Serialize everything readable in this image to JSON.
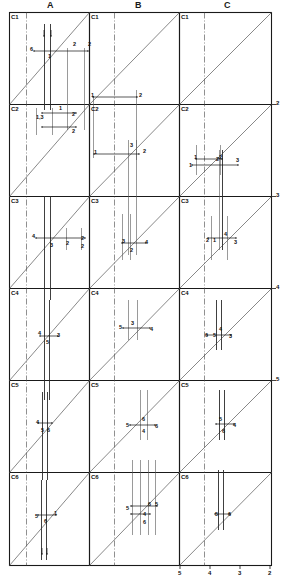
{
  "figure": {
    "type": "technical-grid-diagram",
    "width": 281,
    "height": 579,
    "columns": [
      {
        "key": "A",
        "label": "A",
        "x_header": 51
      },
      {
        "key": "B",
        "label": "B",
        "x_header": 139
      },
      {
        "key": "C",
        "label": "C",
        "x_header": 228
      }
    ],
    "rows": [
      {
        "key": "C1",
        "label": "C1"
      },
      {
        "key": "C2",
        "label": "C2"
      },
      {
        "key": "C3",
        "label": "C3"
      },
      {
        "key": "C4",
        "label": "C4"
      },
      {
        "key": "C5",
        "label": "C5"
      },
      {
        "key": "C6",
        "label": "C6"
      }
    ],
    "cell_ids": [
      "C1",
      "C1",
      "C1",
      "C2",
      "C2",
      "C2",
      "C3",
      "C3",
      "C3",
      "C4",
      "C4",
      "C4",
      "C5",
      "C5",
      "C5",
      "C6",
      "C6",
      "C6"
    ],
    "bottom_axis_ticks": [
      "5",
      "4",
      "3",
      "2"
    ],
    "right_axis_ticks": [
      "2",
      "3",
      "4",
      "5"
    ],
    "annotations_A": [
      {
        "text": "6",
        "x": 30,
        "y": 47
      },
      {
        "text": "1",
        "x": 48,
        "y": 54
      },
      {
        "text": "2",
        "x": 73,
        "y": 42
      },
      {
        "text": "2",
        "x": 88,
        "y": 42
      },
      {
        "text": "1,3",
        "x": 36,
        "y": 115
      },
      {
        "text": "1",
        "x": 59,
        "y": 106
      },
      {
        "text": "2",
        "x": 72,
        "y": 112
      },
      {
        "text": "2",
        "x": 72,
        "y": 129
      },
      {
        "text": "4",
        "x": 32,
        "y": 234
      },
      {
        "text": "3",
        "x": 50,
        "y": 243
      },
      {
        "text": "2",
        "x": 66,
        "y": 241
      },
      {
        "text": "2",
        "x": 81,
        "y": 236
      },
      {
        "text": "2",
        "x": 81,
        "y": 244
      },
      {
        "text": "4",
        "x": 38,
        "y": 331
      },
      {
        "text": "5",
        "x": 46,
        "y": 340
      },
      {
        "text": "3",
        "x": 57,
        "y": 333
      },
      {
        "text": "4",
        "x": 36,
        "y": 420
      },
      {
        "text": "5",
        "x": 41,
        "y": 428
      },
      {
        "text": "6",
        "x": 47,
        "y": 428
      },
      {
        "text": "5",
        "x": 35,
        "y": 514
      },
      {
        "text": "6",
        "x": 44,
        "y": 519
      },
      {
        "text": "1",
        "x": 54,
        "y": 511
      }
    ],
    "annotations_B": [
      {
        "text": "1",
        "x": 91,
        "y": 93
      },
      {
        "text": "2",
        "x": 139,
        "y": 93
      },
      {
        "text": "1",
        "x": 94,
        "y": 150
      },
      {
        "text": "3",
        "x": 130,
        "y": 143
      },
      {
        "text": "2",
        "x": 143,
        "y": 149
      },
      {
        "text": "3",
        "x": 122,
        "y": 239
      },
      {
        "text": "2",
        "x": 130,
        "y": 248
      },
      {
        "text": "4",
        "x": 145,
        "y": 240
      },
      {
        "text": "5",
        "x": 119,
        "y": 325
      },
      {
        "text": "3",
        "x": 131,
        "y": 321
      },
      {
        "text": "4",
        "x": 150,
        "y": 327
      },
      {
        "text": "5",
        "x": 126,
        "y": 423
      },
      {
        "text": "6",
        "x": 142,
        "y": 417
      },
      {
        "text": "4",
        "x": 142,
        "y": 429
      },
      {
        "text": "6",
        "x": 155,
        "y": 424
      },
      {
        "text": "5",
        "x": 126,
        "y": 506
      },
      {
        "text": "6",
        "x": 148,
        "y": 502
      },
      {
        "text": "5",
        "x": 155,
        "y": 502
      },
      {
        "text": "4",
        "x": 143,
        "y": 512
      },
      {
        "text": "6",
        "x": 143,
        "y": 520
      }
    ],
    "annotations_C": [
      {
        "text": "1",
        "x": 194,
        "y": 155
      },
      {
        "text": "2",
        "x": 219,
        "y": 155
      },
      {
        "text": "1",
        "x": 189,
        "y": 163
      },
      {
        "text": "2",
        "x": 216,
        "y": 157
      },
      {
        "text": "3",
        "x": 236,
        "y": 158
      },
      {
        "text": "2",
        "x": 206,
        "y": 238
      },
      {
        "text": "1",
        "x": 213,
        "y": 238
      },
      {
        "text": "4",
        "x": 224,
        "y": 232
      },
      {
        "text": "3",
        "x": 234,
        "y": 240
      },
      {
        "text": "6",
        "x": 205,
        "y": 333
      },
      {
        "text": "5",
        "x": 213,
        "y": 333
      },
      {
        "text": "4",
        "x": 219,
        "y": 327
      },
      {
        "text": "3",
        "x": 229,
        "y": 334
      },
      {
        "text": "5",
        "x": 219,
        "y": 417
      },
      {
        "text": "6",
        "x": 222,
        "y": 429
      },
      {
        "text": "4",
        "x": 233,
        "y": 423
      },
      {
        "text": "5",
        "x": 215,
        "y": 512
      },
      {
        "text": "6",
        "x": 228,
        "y": 512
      }
    ]
  }
}
